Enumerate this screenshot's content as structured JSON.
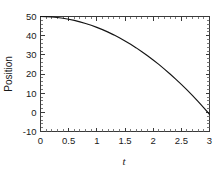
{
  "chart_data": {
    "type": "line",
    "title": "",
    "xlabel": "t",
    "ylabel": "Position",
    "xlim": [
      0,
      3
    ],
    "ylim": [
      -10,
      50
    ],
    "grid": false,
    "legend": null,
    "xticks": [
      0,
      0.5,
      1,
      1.5,
      2,
      2.5,
      3
    ],
    "xticklabels": [
      "0",
      "0.5",
      "1",
      "1.5",
      "2",
      "2.5",
      "3"
    ],
    "yticks": [
      -10,
      0,
      10,
      20,
      30,
      40,
      50
    ],
    "yticklabels": [
      "-10",
      "0",
      "10",
      "20",
      "30",
      "40",
      "50"
    ],
    "x_minor_tick_interval": 0.1,
    "y_minor_tick_interval": 2,
    "series": [
      {
        "name": "Position",
        "color": "#141414",
        "x": [
          0,
          0.1,
          0.2,
          0.3,
          0.4,
          0.5,
          0.6,
          0.7,
          0.8,
          0.9,
          1.0,
          1.1,
          1.2,
          1.3,
          1.4,
          1.5,
          1.6,
          1.7,
          1.8,
          1.9,
          2.0,
          2.1,
          2.2,
          2.3,
          2.4,
          2.5,
          2.6,
          2.7,
          2.8,
          2.9,
          3.0
        ],
        "y": [
          50.0,
          49.94,
          49.77,
          49.49,
          49.09,
          48.58,
          47.96,
          47.22,
          46.37,
          45.41,
          44.33,
          43.14,
          41.84,
          40.42,
          38.89,
          37.25,
          35.49,
          33.62,
          31.64,
          29.54,
          27.33,
          25.01,
          22.57,
          20.02,
          17.36,
          14.58,
          11.69,
          8.69,
          5.57,
          2.34,
          -1.0
        ]
      }
    ]
  },
  "figure": {
    "background_color": "#ffffff",
    "axis_color": "#3a3a3a",
    "curve_color": "#141414"
  }
}
